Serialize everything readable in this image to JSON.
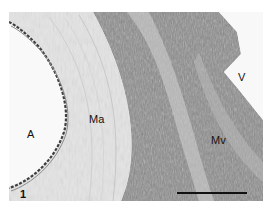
{
  "figure": {
    "panel_number": "1",
    "labels": {
      "artery_lumen": "A",
      "artery_media": "Ma",
      "vein_lumen": "V",
      "vein_media": "Mv"
    },
    "scale_bar": {
      "present": true,
      "color": "#111111"
    },
    "colors": {
      "background": "#ffffff",
      "lumen": "#f7f7f7",
      "artery_wall": "#e6e6e6",
      "vein_wall": "#8a8a8a",
      "intima_edge": "#444444"
    }
  }
}
